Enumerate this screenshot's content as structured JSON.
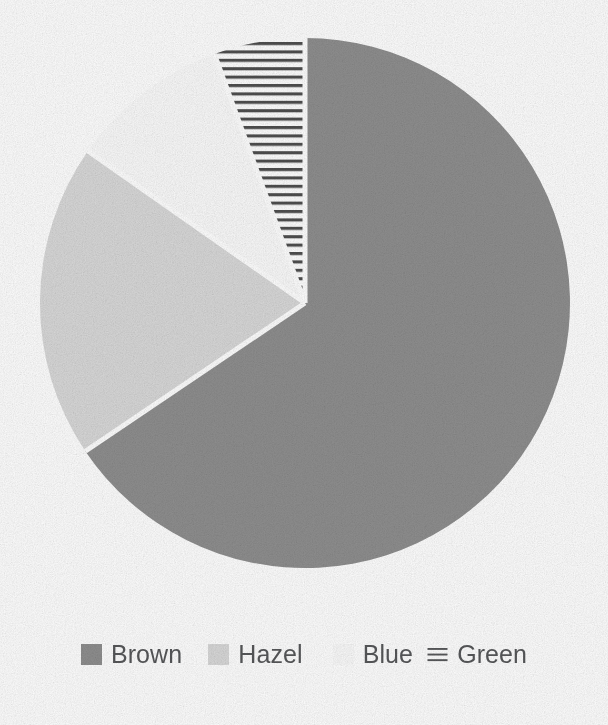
{
  "chart_data": {
    "type": "pie",
    "title": "",
    "subtitle": "",
    "xlabel": "",
    "ylabel": "",
    "grid": false,
    "legend_position": "bottom",
    "start_angle_deg": 0,
    "direction": "clockwise",
    "categories": [
      "Brown",
      "Hazel",
      "Blue",
      "Green"
    ],
    "values": [
      65.5,
      19.2,
      9.7,
      5.6
    ],
    "units": "percent",
    "slices": [
      {
        "label": "Brown",
        "value": 65.5,
        "start_deg": 0,
        "end_deg": 236,
        "fill": "#8f8f8f",
        "pattern": "solid",
        "swatch_name": "legend-swatch-brown"
      },
      {
        "label": "Hazel",
        "value": 19.2,
        "start_deg": 236,
        "end_deg": 305,
        "fill": "#d9d9d9",
        "pattern": "solid",
        "swatch_name": "legend-swatch-hazel"
      },
      {
        "label": "Blue",
        "value": 9.7,
        "start_deg": 305,
        "end_deg": 340,
        "fill": "#fbfbfb",
        "pattern": "solid",
        "swatch_name": "legend-swatch-blue"
      },
      {
        "label": "Green",
        "value": 5.6,
        "start_deg": 340,
        "end_deg": 360,
        "fill": "#ffffff",
        "pattern": "horizontal-hatch",
        "swatch_name": "legend-swatch-green"
      }
    ],
    "geometry": {
      "center_x": 305,
      "center_y": 303,
      "radius": 265,
      "separator_color": "#ffffff",
      "separator_width": 5
    }
  },
  "legend": {
    "items": [
      {
        "label": "Brown",
        "swatch": "solid-swatch",
        "color": "#8f8f8f"
      },
      {
        "label": "Hazel",
        "swatch": "solid-swatch",
        "color": "#d9d9d9"
      },
      {
        "label": "Blue",
        "swatch": "solid-swatch",
        "color": "#fbfbfb"
      },
      {
        "label": "Green",
        "swatch": "hatch-swatch",
        "color": "#5a5a5a"
      }
    ]
  },
  "colors": {
    "brown": "#8f8f8f",
    "hazel": "#d9d9d9",
    "blue": "#fbfbfb",
    "green_hatch": "#4a4a4a",
    "legend_text": "#57585a",
    "background": "#ffffff"
  }
}
